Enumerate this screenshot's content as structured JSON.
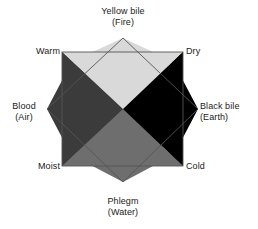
{
  "figure": {
    "geometry": {
      "center": [
        123,
        109
      ],
      "diamond_vertices": [
        [
          123,
          38
        ],
        [
          198,
          109
        ],
        [
          123,
          182
        ],
        [
          47,
          109
        ]
      ],
      "square_rect": [
        62,
        52,
        183,
        166
      ]
    },
    "colors": {
      "fire": "#d9d9d9",
      "air": "#3b3b3b",
      "earth": "#000000",
      "water": "#6e6e6e",
      "outline": "#555555",
      "background": "#ffffff",
      "text": "#1a1a1a"
    },
    "humours": [
      {
        "id": "yellow-bile",
        "name": "Yellow bile",
        "element": "(Fire)",
        "position": "top",
        "color": "#d9d9d9"
      },
      {
        "id": "black-bile",
        "name": "Black bile",
        "element": "(Earth)",
        "position": "right",
        "color": "#000000"
      },
      {
        "id": "phlegm",
        "name": "Phlegm",
        "element": "(Water)",
        "position": "bottom",
        "color": "#6e6e6e"
      },
      {
        "id": "blood",
        "name": "Blood",
        "element": "(Air)",
        "position": "left",
        "color": "#3b3b3b"
      }
    ],
    "qualities": [
      {
        "id": "warm",
        "label": "Warm",
        "position": "top-left"
      },
      {
        "id": "dry",
        "label": "Dry",
        "position": "top-right"
      },
      {
        "id": "cold",
        "label": "Cold",
        "position": "bottom-right"
      },
      {
        "id": "moist",
        "label": "Moist",
        "position": "bottom-left"
      }
    ]
  }
}
